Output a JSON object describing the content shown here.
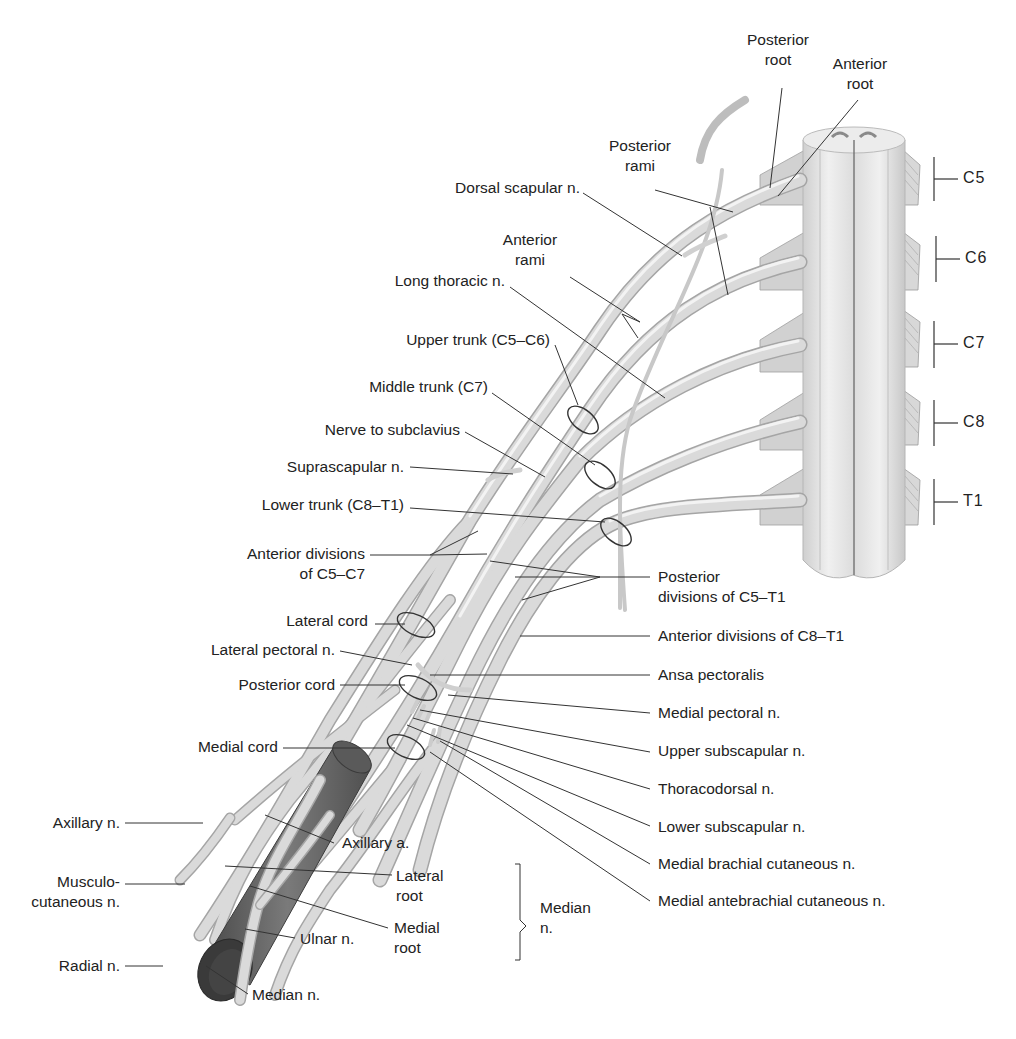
{
  "figure": {
    "colors": {
      "nerve_fill": "#d9d9d9",
      "nerve_edge": "#a8a8a8",
      "nerve_highlight": "#f2f2f2",
      "artery_fill": "#6e6e6e",
      "artery_dark": "#3a3a3a",
      "cord_fill": "#e8e8e8",
      "leader_line": "#333333",
      "text": "#222222",
      "background": "#ffffff"
    }
  },
  "spinal_segments": [
    {
      "id": "C5",
      "label": "C5"
    },
    {
      "id": "C6",
      "label": "C6"
    },
    {
      "id": "C7",
      "label": "C7"
    },
    {
      "id": "C8",
      "label": "C8"
    },
    {
      "id": "T1",
      "label": "T1"
    }
  ],
  "labels": {
    "posterior_root": {
      "line1": "Posterior",
      "line2": "root"
    },
    "anterior_root": {
      "line1": "Anterior",
      "line2": "root"
    },
    "posterior_rami": {
      "line1": "Posterior",
      "line2": "rami"
    },
    "dorsal_scapular": "Dorsal scapular n.",
    "anterior_rami": {
      "line1": "Anterior",
      "line2": "rami"
    },
    "long_thoracic": "Long thoracic n.",
    "upper_trunk": "Upper trunk (C5–C6)",
    "middle_trunk": "Middle trunk (C7)",
    "nerve_to_subclavius": "Nerve to subclavius",
    "suprascapular": "Suprascapular n.",
    "lower_trunk": "Lower trunk (C8–T1)",
    "anterior_divisions_c5c7": {
      "line1": "Anterior divisions",
      "line2": "of C5–C7"
    },
    "posterior_divisions": {
      "line1": "Posterior",
      "line2": "divisions of C5–T1"
    },
    "lateral_cord": "Lateral cord",
    "anterior_divisions_c8t1": "Anterior divisions of C8–T1",
    "lateral_pectoral": "Lateral pectoral n.",
    "ansa_pectoralis": "Ansa pectoralis",
    "posterior_cord": "Posterior cord",
    "medial_pectoral": "Medial pectoral n.",
    "upper_subscapular": "Upper subscapular n.",
    "medial_cord": "Medial cord",
    "thoracodorsal": "Thoracodorsal n.",
    "lower_subscapular": "Lower subscapular n.",
    "medial_brachial_cutaneous": "Medial brachial cutaneous n.",
    "medial_antebrachial_cutaneous": "Medial antebrachial cutaneous n.",
    "axillary_n": "Axillary n.",
    "axillary_a": "Axillary a.",
    "musculocutaneous": {
      "line1": "Musculo-",
      "line2": "cutaneous n."
    },
    "lateral_root": {
      "line1": "Lateral",
      "line2": "root"
    },
    "medial_root": {
      "line1": "Medial",
      "line2": "root"
    },
    "median_bracket": {
      "line1": "Median",
      "line2": "n."
    },
    "ulnar": "Ulnar n.",
    "radial": "Radial n.",
    "median_n": "Median n."
  }
}
